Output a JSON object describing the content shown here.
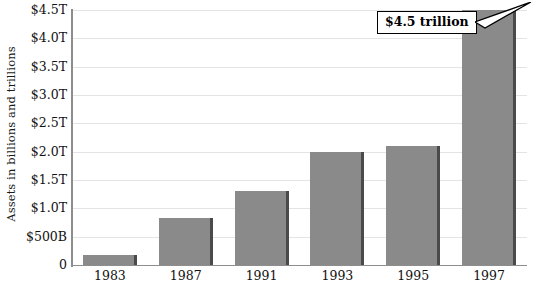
{
  "chart_data": {
    "type": "bar",
    "title": "",
    "subtitle": "",
    "xlabel": "",
    "ylabel": "Assets in billions and trillions",
    "categories": [
      "1983",
      "1987",
      "1991",
      "1993",
      "1995",
      "1997"
    ],
    "values": [
      0.17,
      0.83,
      1.3,
      2.0,
      2.1,
      4.5
    ],
    "value_unit": "trillions of dollars",
    "ylim": [
      0,
      4.5
    ],
    "ytick_values": [
      0,
      0.5,
      1.0,
      1.5,
      2.0,
      2.5,
      3.0,
      3.5,
      4.0,
      4.5
    ],
    "ytick_labels": [
      "0",
      "$500B",
      "$1.0T",
      "$1.5T",
      "$2.0T",
      "$2.5T",
      "$3.0T",
      "$3.5T",
      "$4.0T",
      "$4.5T"
    ],
    "grid": true,
    "legend": false,
    "legend_position": "none",
    "annotations": [
      {
        "text": "$4.5 trillion",
        "points_to_category": "1997",
        "points_to_value": 4.5
      }
    ],
    "series": [
      {
        "name": "Assets",
        "values": [
          0.17,
          0.83,
          1.3,
          2.0,
          2.1,
          4.5
        ]
      }
    ]
  },
  "colors": {
    "bar_fill": "#8a8a8a",
    "bar_edge": "#4a4a4a",
    "gridline": "#e4e4e4",
    "axis": "#8d8d8d",
    "text": "#111111",
    "callout_border": "#000000",
    "callout_background": "#ffffff"
  },
  "annotation": {
    "callout_label": "$4.5 trillion"
  },
  "axis": {
    "y_title": "Assets in billions and trillions"
  }
}
